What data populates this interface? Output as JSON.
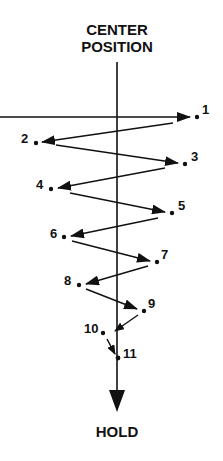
{
  "diagram": {
    "title_line1": "CENTER",
    "title_line2": "POSITION",
    "end_label": "HOLD",
    "points": [
      {
        "label": "1",
        "x": 197,
        "y": 117
      },
      {
        "label": "2",
        "x": 36,
        "y": 143
      },
      {
        "label": "3",
        "x": 185,
        "y": 164
      },
      {
        "label": "4",
        "x": 51,
        "y": 189
      },
      {
        "label": "5",
        "x": 172,
        "y": 213
      },
      {
        "label": "6",
        "x": 64,
        "y": 237
      },
      {
        "label": "7",
        "x": 157,
        "y": 262
      },
      {
        "label": "8",
        "x": 79,
        "y": 285
      },
      {
        "label": "9",
        "x": 144,
        "y": 311
      },
      {
        "label": "10",
        "x": 103,
        "y": 333
      },
      {
        "label": "11",
        "x": 118,
        "y": 358
      }
    ],
    "colors": {
      "ink": "#111111",
      "background": "#ffffff"
    }
  }
}
